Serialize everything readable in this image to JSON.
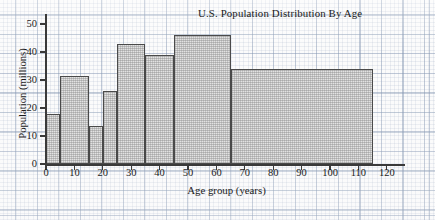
{
  "chart_data": {
    "type": "bar",
    "title": "U.S. Population Distribution By Age",
    "xlabel": "Age group (years)",
    "ylabel": "Population (millions)",
    "xlim": [
      0,
      120
    ],
    "ylim": [
      0,
      50
    ],
    "grid": true,
    "legend": "none",
    "xticks": [
      0,
      10,
      20,
      30,
      40,
      50,
      60,
      70,
      80,
      90,
      100,
      110,
      120
    ],
    "yticks": [
      0,
      10,
      20,
      30,
      40,
      50
    ],
    "bins": [
      {
        "label": "0-5",
        "start": 0,
        "end": 5,
        "value": 18
      },
      {
        "label": "5-15",
        "start": 5,
        "end": 15,
        "value": 31.5
      },
      {
        "label": "15-20",
        "start": 15,
        "end": 20,
        "value": 13.5
      },
      {
        "label": "20-25",
        "start": 20,
        "end": 25,
        "value": 26
      },
      {
        "label": "25-35",
        "start": 25,
        "end": 35,
        "value": 43
      },
      {
        "label": "35-45",
        "start": 35,
        "end": 45,
        "value": 39
      },
      {
        "label": "45-65",
        "start": 45,
        "end": 65,
        "value": 46
      },
      {
        "label": "65-115",
        "start": 65,
        "end": 115,
        "value": 34
      }
    ],
    "categories": [
      "0-5",
      "5-15",
      "15-20",
      "20-25",
      "25-35",
      "35-45",
      "45-65",
      "65-115"
    ],
    "values": [
      18,
      31.5,
      13.5,
      26,
      43,
      39,
      46,
      34
    ],
    "colors": {
      "bar_fill": "#e2e2e2",
      "bar_edge": "#4a4a4a",
      "axis": "#3a3a3a",
      "grid": "#8aa0be",
      "text": "#1b1b1b",
      "background": "#fbfbfb"
    }
  }
}
